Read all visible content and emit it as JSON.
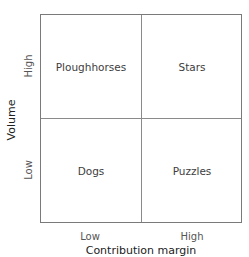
{
  "diagram": {
    "title_fragment": "",
    "x_axis": {
      "title": "Contribution margin",
      "ticks": [
        "Low",
        "High"
      ]
    },
    "y_axis": {
      "title": "Volume",
      "ticks": [
        "Low",
        "High"
      ]
    },
    "quadrants": {
      "top_left": "Ploughhorses",
      "top_right": "Stars",
      "bottom_left": "Dogs",
      "bottom_right": "Puzzles"
    }
  }
}
